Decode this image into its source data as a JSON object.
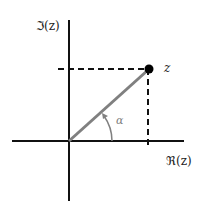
{
  "diagram": {
    "labels": {
      "imag_axis": "ℑ(z)",
      "real_axis": "ℜ(z)",
      "point": "z",
      "angle": "α"
    },
    "colors": {
      "axes": "#111111",
      "vector": "#808080",
      "point": "#000000",
      "dashed": "#111111"
    }
  }
}
